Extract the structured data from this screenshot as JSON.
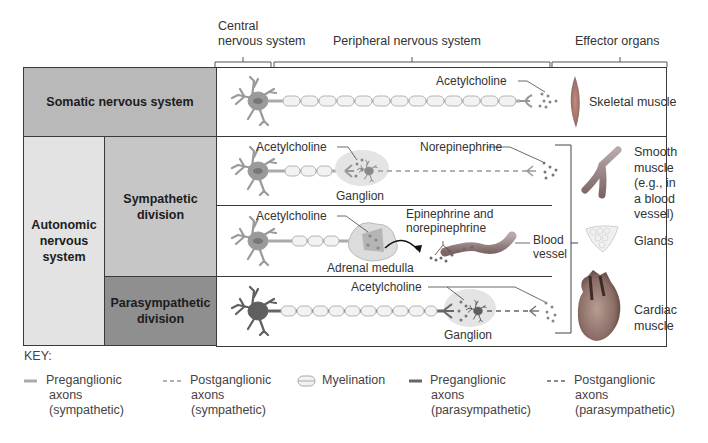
{
  "headers": {
    "cns": [
      "Central",
      "nervous system"
    ],
    "pns": "Peripheral nervous system",
    "effectors": "Effector organs"
  },
  "rows": {
    "somatic": "Somatic nervous system",
    "autonomic": [
      "Autonomic",
      "nervous",
      "system"
    ],
    "sympathetic": [
      "Sympathetic",
      "division"
    ],
    "parasympathetic": [
      "Parasympathetic",
      "division"
    ]
  },
  "labels": {
    "somatic_ach": "Acetylcholine",
    "symp_ach": "Acetylcholine",
    "symp_ganglion": "Ganglion",
    "norepinephrine": "Norepinephrine",
    "adrenal_ach": "Acetylcholine",
    "epi_norepi": [
      "Epinephrine and",
      "norepinephrine"
    ],
    "adrenal_medulla": "Adrenal medulla",
    "blood_vessel": [
      "Blood",
      "vessel"
    ],
    "para_ach": "Acetylcholine",
    "para_ganglion": "Ganglion"
  },
  "effectors": {
    "skeletal": "Skeletal muscle",
    "smooth": [
      "Smooth",
      "muscle",
      "(e.g., in",
      "a blood",
      "vessel)"
    ],
    "glands": "Glands",
    "cardiac": [
      "Cardiac",
      "muscle"
    ]
  },
  "key": {
    "title": "KEY:",
    "items": [
      {
        "symbol": "solid-light",
        "lines": [
          "Preganglionic",
          "axons",
          "(sympathetic)"
        ]
      },
      {
        "symbol": "dashed-light",
        "lines": [
          "Postganglionic",
          "axons",
          "(sympathetic)"
        ]
      },
      {
        "symbol": "myelination",
        "lines": [
          "Myelination"
        ]
      },
      {
        "symbol": "solid-dark",
        "lines": [
          "Preganglionic",
          "axons",
          "(parasympathetic)"
        ]
      },
      {
        "symbol": "dashed-dark",
        "lines": [
          "Postganglionic",
          "axons",
          "(parasympathetic)"
        ]
      }
    ]
  },
  "colors": {
    "somatic_fill": "#b9b9b9",
    "autonomic_fill": "#e3e3e3",
    "sympathetic_fill": "#c6c6c6",
    "parasympathetic_fill": "#8f8f8f",
    "neuron_light": "#9a9a9a",
    "neuron_dark": "#5f5f5f"
  }
}
